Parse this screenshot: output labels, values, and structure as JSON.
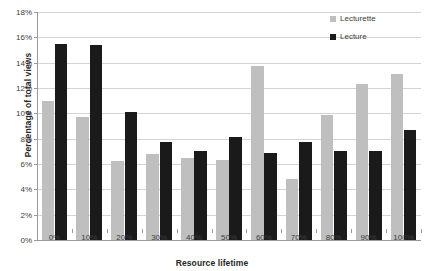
{
  "chart_data": {
    "type": "bar",
    "title": "",
    "xlabel": "Resource lifetime",
    "ylabel": "Percentage of total views",
    "categories": [
      "0%",
      "10%",
      "20%",
      "30%",
      "40%",
      "50%",
      "60%",
      "70%",
      "80%",
      "90%",
      "100%"
    ],
    "ylim": [
      0,
      18
    ],
    "ytick_labels": [
      "0%",
      "2%",
      "4%",
      "6%",
      "8%",
      "10%",
      "12%",
      "14%",
      "16%",
      "18%"
    ],
    "ytick_values": [
      0,
      2,
      4,
      6,
      8,
      10,
      12,
      14,
      16,
      18
    ],
    "grid": true,
    "legend_position": "top-right",
    "series": [
      {
        "name": "Lecturette",
        "color": "#bfbfbf",
        "values": [
          11.0,
          9.7,
          6.2,
          6.8,
          6.5,
          6.3,
          13.7,
          4.8,
          9.9,
          12.3,
          13.1
        ]
      },
      {
        "name": "Lecture",
        "color": "#1a1a1a",
        "values": [
          15.5,
          15.4,
          10.1,
          7.7,
          7.0,
          8.1,
          6.9,
          7.7,
          7.0,
          7.0,
          8.7
        ]
      }
    ]
  }
}
